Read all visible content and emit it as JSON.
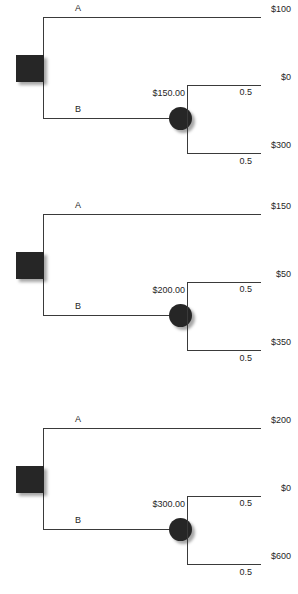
{
  "diagram": {
    "type": "decision-tree",
    "node_types": {
      "decision": "square",
      "chance": "circle"
    },
    "colors": {
      "node_fill": "#262626",
      "line": "#3a3a3a",
      "background": "#ffffff",
      "text": "#1f1f1f"
    },
    "trees": [
      {
        "id": "tree-1",
        "decision_node": {
          "label": ""
        },
        "branches": [
          {
            "label": "A",
            "kind": "terminal",
            "payoff": "$100"
          },
          {
            "label": "B",
            "kind": "chance",
            "expected_value": "$150.00",
            "outcomes": [
              {
                "payoff": "$0",
                "probability": "0.5"
              },
              {
                "payoff": "$300",
                "probability": "0.5"
              }
            ]
          }
        ]
      },
      {
        "id": "tree-2",
        "decision_node": {
          "label": ""
        },
        "branches": [
          {
            "label": "A",
            "kind": "terminal",
            "payoff": "$150"
          },
          {
            "label": "B",
            "kind": "chance",
            "expected_value": "$200.00",
            "outcomes": [
              {
                "payoff": "$50",
                "probability": "0.5"
              },
              {
                "payoff": "$350",
                "probability": "0.5"
              }
            ]
          }
        ]
      },
      {
        "id": "tree-3",
        "decision_node": {
          "label": ""
        },
        "branches": [
          {
            "label": "A",
            "kind": "terminal",
            "payoff": "$200"
          },
          {
            "label": "B",
            "kind": "chance",
            "expected_value": "$300.00",
            "outcomes": [
              {
                "payoff": "$0",
                "probability": "0.5"
              },
              {
                "payoff": "$600",
                "probability": "0.5"
              }
            ]
          }
        ]
      }
    ]
  }
}
